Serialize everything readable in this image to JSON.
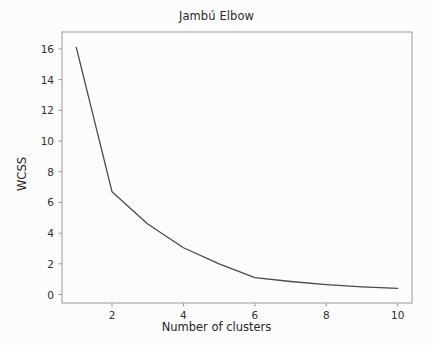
{
  "chart_data": {
    "type": "line",
    "title": "Jambú Elbow",
    "xlabel": "Number of clusters",
    "ylabel": "WCSS",
    "x": [
      1,
      2,
      3,
      4,
      5,
      6,
      7,
      8,
      9,
      10
    ],
    "values": [
      16.1,
      6.7,
      4.6,
      3.05,
      2.0,
      1.1,
      0.85,
      0.65,
      0.5,
      0.4
    ],
    "xlim": [
      0.6,
      10.4
    ],
    "ylim": [
      -0.55,
      17.1
    ],
    "xticks": [
      2,
      4,
      6,
      8,
      10
    ],
    "xtick_labels": [
      "2",
      "4",
      "6",
      "8",
      "10"
    ],
    "yticks": [
      0,
      2,
      4,
      6,
      8,
      10,
      12,
      14,
      16
    ],
    "ytick_labels": [
      "0",
      "2",
      "4",
      "6",
      "8",
      "10",
      "12",
      "14",
      "16"
    ],
    "grid": false,
    "legend": false,
    "line_color": "#4a4a4a",
    "frame_color": "#9a9a9a",
    "background_color": "#fcfcfc"
  }
}
